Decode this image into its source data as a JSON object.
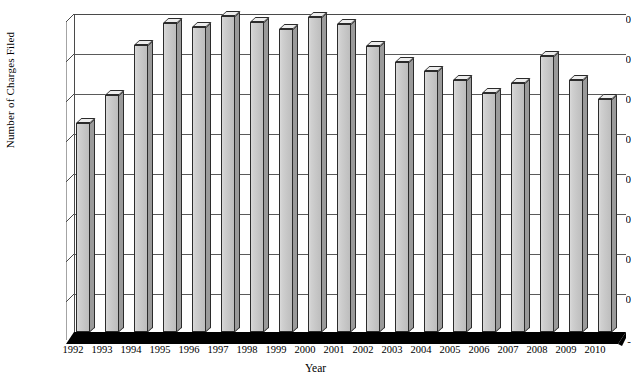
{
  "chart_data": {
    "type": "bar",
    "title": "",
    "xlabel": "Year",
    "ylabel": "Number of Charges Filed",
    "ylim": [
      0,
      16000
    ],
    "ytick_values": [
      0,
      2000,
      4000,
      6000,
      8000,
      10000,
      12000,
      14000,
      16000
    ],
    "ytick_labels": [
      "-",
      "2,000",
      "4,000",
      "6,000",
      "8,000",
      "10,000",
      "12,000",
      "14,000",
      "16,000"
    ],
    "gridlines": [
      2000,
      4000,
      6000,
      8000,
      10000,
      12000,
      14000,
      16000
    ],
    "grid": true,
    "legend": "none",
    "categories": [
      "1992",
      "1993",
      "1994",
      "1995",
      "1996",
      "1997",
      "1998",
      "1999",
      "2000",
      "2001",
      "2002",
      "2003",
      "2004",
      "2005",
      "2006",
      "2007",
      "2008",
      "2009",
      "2010"
    ],
    "values": [
      10499,
      11908,
      14420,
      15549,
      15342,
      15889,
      15618,
      15222,
      15836,
      15478,
      14396,
      13566,
      13136,
      12679,
      12025,
      12510,
      13867,
      12696,
      11717
    ],
    "series": [
      {
        "name": "Number of Charges Filed",
        "values": [
          10499,
          11908,
          14420,
          15549,
          15342,
          15889,
          15618,
          15222,
          15836,
          15478,
          14396,
          13566,
          13136,
          12679,
          12025,
          12510,
          13867,
          12696,
          11717
        ]
      }
    ],
    "style": {
      "bar_fill": "#c8c8c8",
      "bar_top": "#ededed",
      "bar_side": "#9a9a9a",
      "bar_outline": "#2b2b2b",
      "floor_color": "#000000",
      "grid_color": "#5a5a5a",
      "background": "#ffffff",
      "three_d": true
    }
  }
}
